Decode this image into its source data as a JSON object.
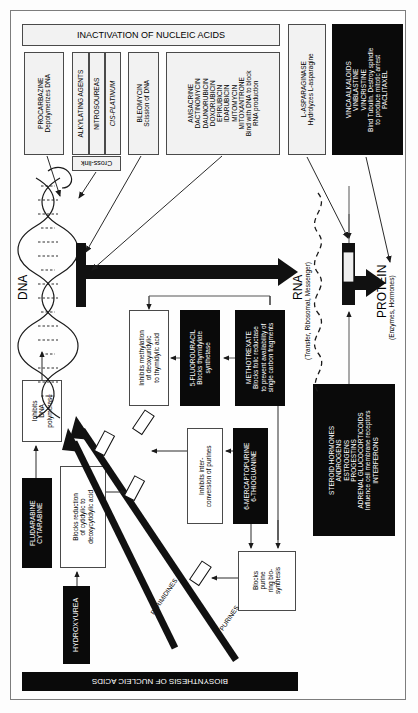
{
  "diagram": {
    "header_banner": "INACTIVATION OF NUCLEIC ACIDS",
    "footer_banner": "BIOSYNTHESIS OF NUCLEIC ACIDS",
    "central_labels": {
      "dna": "DNA",
      "rna": "RNA",
      "rna_sub": "(Transfer, Ribosomal, Messenger)",
      "protein": "PROTEIN",
      "protein_sub": "(Enzymes, Hormones)",
      "pyrimidines": "PYRIMIDINES",
      "purines": "PURINES"
    },
    "top_boxes": [
      {
        "name": "procarbazine",
        "style": "light",
        "lines": [
          "PROCARBAZINE",
          "Depolymerizes DNA"
        ]
      },
      {
        "name": "alkylating-agents",
        "style": "light",
        "lines": [
          "ALKYLATING AGENTS"
        ]
      },
      {
        "name": "nitrosoureas",
        "style": "light",
        "lines": [
          "NITROSOUREAS"
        ]
      },
      {
        "name": "cis-platinum",
        "style": "light",
        "lines": [
          "CIS-PLATINUM"
        ]
      },
      {
        "name": "cross-link",
        "style": "light",
        "lines": [
          "Cross-link"
        ]
      },
      {
        "name": "bleomycin",
        "style": "light",
        "lines": [
          "BLEOMYCIN",
          "Scission of DNA"
        ]
      },
      {
        "name": "intercalators",
        "style": "light",
        "lines": [
          "AMSACRINE",
          "DACTINOMYCIN",
          "DAUNORUBICIN",
          "DOXORUBICIN",
          "EPIRUBICIN",
          "IDARUBICIN",
          "MITOMYCIN",
          "MITOXANTRONE",
          "Bind with DNA to block",
          "RNA production"
        ]
      },
      {
        "name": "l-asparaginase",
        "style": "light",
        "lines": [
          "L-ASPARAGINASE",
          "Hydrolyzes L-asparagine"
        ]
      },
      {
        "name": "vinca-alkaloids",
        "style": "black",
        "lines": [
          "VINCA ALKALOIDS",
          "VINBLASTINE",
          "VINCRISTINE",
          "Bind Tubulin. Destroy spindle",
          "to produce mitotic arrest",
          "PACLITAXEL"
        ]
      }
    ],
    "mid_boxes": [
      {
        "name": "inhibits-methylation",
        "style": "white",
        "lines": [
          "Inhibits methylation",
          "of deoxyuridylic",
          "to thymidylic acid"
        ]
      },
      {
        "name": "5-fluorouracil",
        "style": "black",
        "lines": [
          "5-FLUOROURACIL",
          "Blocks thymidylate",
          "synthetase"
        ]
      },
      {
        "name": "methotrexate",
        "style": "black",
        "lines": [
          "METHOTREXATE",
          "Blocks folic reductase",
          "to prevent availability of",
          "single carbon fragments"
        ]
      },
      {
        "name": "steroid-hormones",
        "style": "black",
        "lines": [
          "STEROID HORMONES",
          "ANDROGENS",
          "ESTROGENS",
          "PROGESTINS",
          "ADRENAL GLUCOCORTICOIDS",
          "Influence cell membrane receptors",
          "INTERFERONS"
        ]
      }
    ],
    "lower_boxes": [
      {
        "name": "inhibits-dna-polymerase",
        "style": "white",
        "lines": [
          "Inhibits",
          "DNA",
          "polymerase"
        ]
      },
      {
        "name": "fludarabine-cytarabine",
        "style": "black",
        "lines": [
          "FLUDARABINE",
          "CYTARABINE"
        ]
      },
      {
        "name": "blocks-reduction",
        "style": "white",
        "lines": [
          "Blocks reduction",
          "of cytidylic to",
          "deoxycytidylic acid"
        ]
      },
      {
        "name": "hydroxyurea",
        "style": "black",
        "lines": [
          "HYDROXYUREA"
        ]
      },
      {
        "name": "inhibits-interconversion",
        "style": "white",
        "lines": [
          "Inhibits inter-",
          "conversion of purines"
        ]
      },
      {
        "name": "6-mercaptopurine",
        "style": "black",
        "lines": [
          "6-MERCAPTOPURINE",
          "6-THIOGUANINE"
        ]
      },
      {
        "name": "blocks-purine-ring",
        "style": "white",
        "lines": [
          "Blocks",
          "purine",
          "ring bio-",
          "synthesis"
        ]
      }
    ],
    "colors": {
      "black_fill": "#0a0a0a",
      "light_fill": "#f2f2f2",
      "white_fill": "#ffffff",
      "border": "#4a4a4a",
      "frame": "#7d7d7d"
    }
  }
}
